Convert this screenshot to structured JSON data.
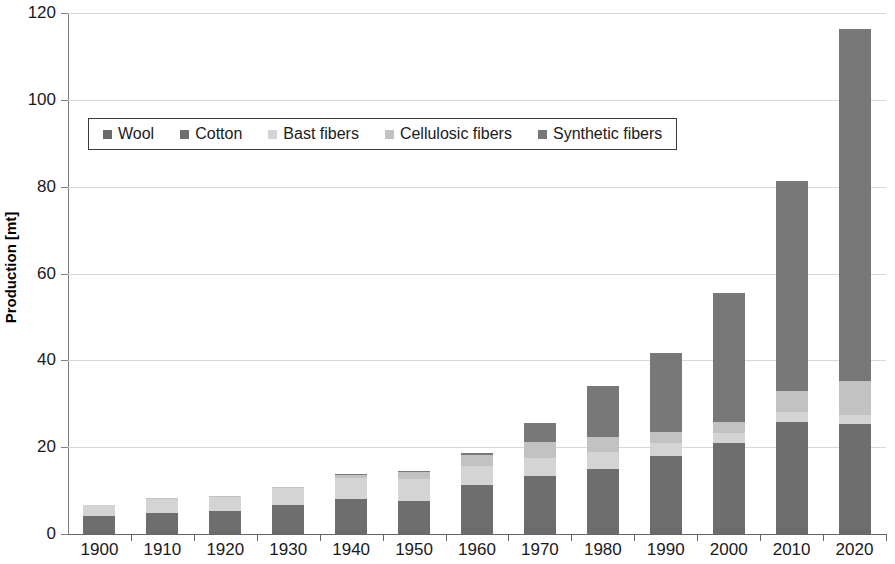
{
  "chart_data": {
    "type": "bar",
    "stacked": true,
    "title": "",
    "xlabel": "",
    "ylabel": "Production [mt]",
    "ylim": [
      0,
      120
    ],
    "yticks": [
      0,
      20,
      40,
      60,
      80,
      100,
      120
    ],
    "grid": true,
    "legend_position": "upper-left-inside",
    "categories": [
      "1900",
      "1910",
      "1920",
      "1930",
      "1940",
      "1950",
      "1960",
      "1970",
      "1980",
      "1990",
      "2000",
      "2010",
      "2020"
    ],
    "series": [
      {
        "name": "Wool",
        "color": "#6b6b6b",
        "values": [
          0.7,
          0.8,
          0.8,
          0.9,
          1.0,
          1.0,
          1.4,
          1.6,
          1.6,
          1.7,
          1.6,
          1.3,
          1.2
        ]
      },
      {
        "name": "Cotton",
        "color": "#6e6e6e",
        "values": [
          3.5,
          4.1,
          4.6,
          5.7,
          7.0,
          6.7,
          10.0,
          11.7,
          13.4,
          16.2,
          19.4,
          24.4,
          24.2
        ]
      },
      {
        "name": "Bast fibers",
        "color": "#d4d4d4",
        "values": [
          2.4,
          3.4,
          3.1,
          3.9,
          5.0,
          5.0,
          4.2,
          4.3,
          4.0,
          3.1,
          2.2,
          2.3,
          2.1
        ]
      },
      {
        "name": "Cellulosic fibers",
        "color": "#c2c2c2",
        "values": [
          0.0,
          0.1,
          0.2,
          0.3,
          0.8,
          1.6,
          2.7,
          3.5,
          3.3,
          2.4,
          2.5,
          5.0,
          7.8
        ]
      },
      {
        "name": "Synthetic fibers",
        "color": "#787878",
        "values": [
          0.0,
          0.0,
          0.0,
          0.0,
          0.1,
          0.2,
          0.4,
          4.5,
          11.8,
          18.3,
          29.8,
          48.2,
          81.1
        ]
      }
    ],
    "totals": [
      6.6,
      8.4,
      8.7,
      10.8,
      13.9,
      14.5,
      18.7,
      25.6,
      34.1,
      41.7,
      55.5,
      81.2,
      116.4
    ]
  },
  "axis": {
    "y_title": "Production [mt]"
  }
}
